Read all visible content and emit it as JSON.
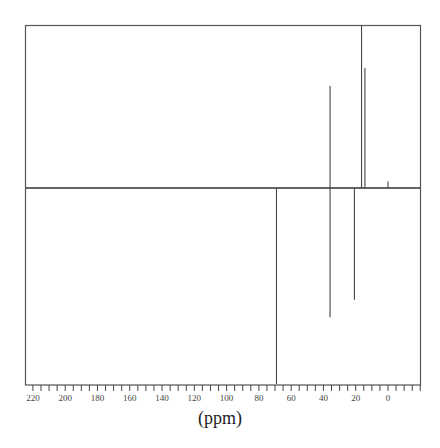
{
  "chart_data": {
    "type": "line",
    "subtype": "nmr-spectrum (DEPT-style, positive and negative peaks)",
    "title": "",
    "xlabel": "(ppm)",
    "ylabel": "",
    "x_reversed": true,
    "xlim": [
      225,
      -20
    ],
    "x_ticks": [
      220,
      200,
      180,
      160,
      140,
      120,
      100,
      80,
      60,
      40,
      20,
      0
    ],
    "minor_tick_step": 5,
    "grid": false,
    "legend": null,
    "baseline_fraction_from_top": 0.453,
    "peaks": [
      {
        "ppm": 69.1,
        "intensity": -1.0
      },
      {
        "ppm": 35.9,
        "intensity": 0.63
      },
      {
        "ppm": 35.9,
        "intensity": -0.66
      },
      {
        "ppm": 20.8,
        "intensity": -0.57
      },
      {
        "ppm": 16.4,
        "intensity": 1.0
      },
      {
        "ppm": 14.3,
        "intensity": 0.74
      },
      {
        "ppm": 0.0,
        "intensity": 0.04
      }
    ]
  },
  "axis": {
    "label": "(ppm)"
  }
}
